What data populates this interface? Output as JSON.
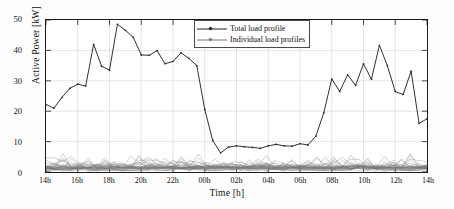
{
  "chart_data": {
    "type": "line",
    "title": "",
    "xlabel": "Time [h]",
    "ylabel": "Active Power [kW]",
    "xlim": [
      0,
      24
    ],
    "ylim": [
      0,
      50
    ],
    "grid": true,
    "legend_position": "top-center",
    "x_tick_labels": [
      "14h",
      "16h",
      "18h",
      "20h",
      "22h",
      "00h",
      "02h",
      "04h",
      "06h",
      "08h",
      "10h",
      "12h",
      "14h"
    ],
    "x_tick_values": [
      0,
      2,
      4,
      6,
      8,
      10,
      12,
      14,
      16,
      18,
      20,
      22,
      24
    ],
    "y_tick_labels": [
      "0",
      "10",
      "20",
      "30",
      "40",
      "50"
    ],
    "y_tick_values": [
      0,
      10,
      20,
      30,
      40,
      50
    ],
    "x": [
      0,
      0.5,
      1,
      1.5,
      2,
      2.5,
      3,
      3.5,
      4,
      4.5,
      5,
      5.5,
      6,
      6.5,
      7,
      7.5,
      8,
      8.5,
      9,
      9.5,
      10,
      10.5,
      11,
      11.5,
      12,
      12.5,
      13,
      13.5,
      14,
      14.5,
      15,
      15.5,
      16,
      16.5,
      17,
      17.5,
      18,
      18.5,
      19,
      19.5,
      20,
      20.5,
      21,
      21.5,
      22,
      22.5,
      23,
      23.5,
      24
    ],
    "series": [
      {
        "name": "Total load profile",
        "color": "#222222",
        "marker": "diamond",
        "values": [
          22.2,
          21.0,
          24.5,
          27.5,
          28.9,
          28.3,
          42.0,
          34.8,
          33.5,
          48.6,
          46.6,
          44.3,
          38.5,
          38.4,
          39.9,
          35.6,
          36.4,
          39.2,
          37.4,
          35.0,
          20.6,
          10.4,
          6.3,
          8.2,
          8.6,
          8.3,
          8.1,
          7.8,
          8.6,
          9.1,
          8.6,
          8.5,
          9.3,
          8.9,
          11.8,
          19.5,
          30.6,
          26.5,
          32.0,
          28.5,
          35.6,
          30.5,
          41.7,
          35.0,
          26.5,
          25.5,
          33.2,
          16.0,
          17.5
        ]
      },
      {
        "name": "Individual load profiles",
        "color": "#777777",
        "marker": "diamond",
        "description": "Dense band of many overlapping individual household load curves ranging from about 0 to 6 kW across the whole day, with occasional small peaks near 5-6 kW.",
        "band_min": 0,
        "band_typical_max": 4,
        "band_peak_max": 6
      }
    ]
  },
  "axes": {
    "ylabel": "Active Power [kW]",
    "xlabel": "Time [h]"
  },
  "legend": {
    "items": [
      {
        "label": "Total load profile"
      },
      {
        "label": "Individual load profiles"
      }
    ]
  }
}
